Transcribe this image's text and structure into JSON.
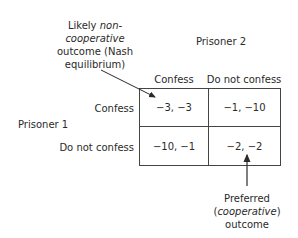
{
  "annotations": {
    "nash": {
      "line1": "Likely ",
      "line1_italic": "non-",
      "line2_italic": "cooperative",
      "line3": "outcome (Nash",
      "line4": "equilibrium)"
    },
    "preferred": {
      "line1": "Preferred",
      "line2_open": "(",
      "line2_italic": "cooperative",
      "line2_close": ")",
      "line3": "outcome"
    }
  },
  "players": {
    "column": "Prisoner 2",
    "row": "Prisoner 1"
  },
  "strategies": {
    "columns": [
      "Confess",
      "Do not confess"
    ],
    "rows": [
      "Confess",
      "Do not confess"
    ]
  },
  "payoffs": [
    [
      "−3, −3",
      "−1, −10"
    ],
    [
      "−10, −1",
      "−2, −2"
    ]
  ]
}
